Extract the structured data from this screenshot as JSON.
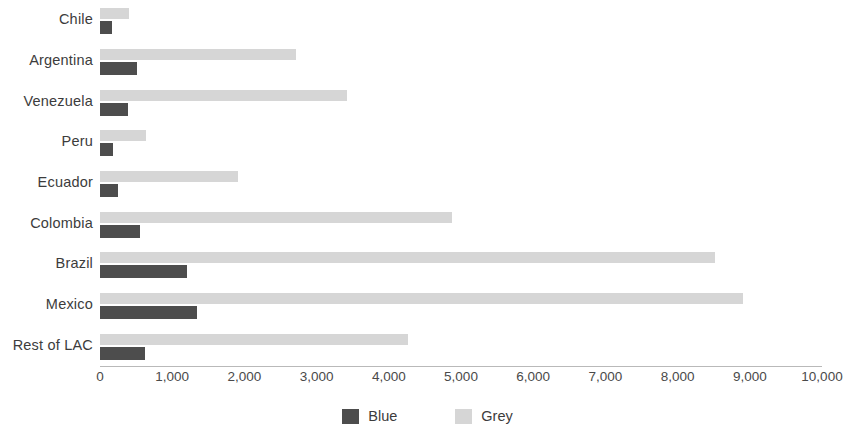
{
  "chart_data": {
    "type": "bar",
    "orientation": "horizontal",
    "title": "",
    "xlabel": "",
    "ylabel": "",
    "xlim": [
      0,
      10000
    ],
    "grid": false,
    "legend_position": "bottom-center",
    "categories": [
      "Chile",
      "Argentina",
      "Venezuela",
      "Peru",
      "Ecuador",
      "Colombia",
      "Brazil",
      "Mexico",
      "Rest of LAC"
    ],
    "xticks": [
      "0",
      "1,000",
      "2,000",
      "3,000",
      "4,000",
      "5,000",
      "6,000",
      "7,000",
      "8,000",
      "9,000",
      "10,000"
    ],
    "xtick_values": [
      0,
      1000,
      2000,
      3000,
      4000,
      5000,
      6000,
      7000,
      8000,
      9000,
      10000
    ],
    "series": [
      {
        "name": "Blue",
        "color": "#4d4d4d",
        "values": [
          160,
          510,
          390,
          180,
          250,
          550,
          1210,
          1340,
          620
        ]
      },
      {
        "name": "Grey",
        "color": "#d6d6d6",
        "values": [
          400,
          2720,
          3420,
          640,
          1910,
          4870,
          8520,
          8900,
          4270
        ]
      }
    ]
  },
  "legend": {
    "items": [
      {
        "label": "Blue",
        "color": "#4d4d4d"
      },
      {
        "label": "Grey",
        "color": "#d6d6d6"
      }
    ]
  }
}
